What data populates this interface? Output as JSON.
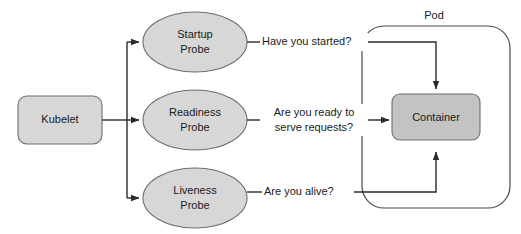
{
  "diagram": {
    "colors": {
      "node_fill_light": "#d7d7d7",
      "node_fill_dark": "#c3c3c3",
      "node_stroke": "#6e6e6e",
      "connector": "#2b2b2b",
      "boundary": "#4a4a4a",
      "text": "#1a1a1a",
      "background": "#ffffff"
    },
    "source": {
      "label": "Kubelet"
    },
    "probes": [
      {
        "line1": "Startup",
        "line2": "Probe",
        "question": "Have you started?"
      },
      {
        "line1": "Readiness",
        "line2": "Probe",
        "question_line1": "Are you ready to",
        "question_line2": "serve requests?"
      },
      {
        "line1": "Liveness",
        "line2": "Probe",
        "question": "Are you alive?"
      }
    ],
    "pod": {
      "label": "Pod",
      "container": {
        "label": "Container"
      }
    }
  }
}
